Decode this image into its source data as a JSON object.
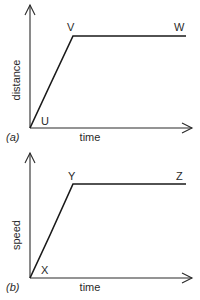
{
  "panels": [
    {
      "id": "a",
      "tag": "(a)",
      "y_label": "distance",
      "x_label": "time",
      "points": [
        {
          "label": "U",
          "x": 30,
          "y": 128
        },
        {
          "label": "V",
          "x": 73,
          "y": 36
        },
        {
          "label": "W",
          "x": 186,
          "y": 36
        }
      ]
    },
    {
      "id": "b",
      "tag": "(b)",
      "y_label": "speed",
      "x_label": "time",
      "points": [
        {
          "label": "X",
          "x": 30,
          "y": 278
        },
        {
          "label": "Y",
          "x": 73,
          "y": 184
        },
        {
          "label": "Z",
          "x": 186,
          "y": 184
        }
      ]
    }
  ]
}
